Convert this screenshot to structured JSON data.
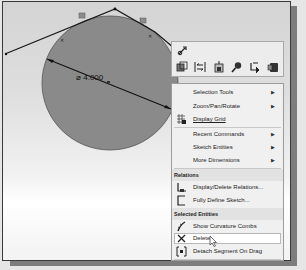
{
  "canvas": {
    "dimension_label": "⌀ 4.000",
    "circle_fill": "#8a8a8a",
    "line_color": "#1a1a1a"
  },
  "context_toolbar": {
    "row1": [
      {
        "name": "rebuild-sketch-icon",
        "glyph": "↹"
      }
    ],
    "row2": [
      {
        "name": "view-orientation-icon",
        "glyph": "▣"
      },
      {
        "name": "dimension-icon",
        "glyph": "↕"
      },
      {
        "name": "smart-dimension-icon",
        "glyph": "▧"
      },
      {
        "name": "zoom-icon",
        "glyph": "⌕"
      },
      {
        "name": "select-other-icon",
        "glyph": "↳"
      },
      {
        "name": "display-style-icon",
        "glyph": "■"
      }
    ]
  },
  "context_menu": {
    "items_top": [
      {
        "label": "Selection Tools",
        "submenu": true
      },
      {
        "label": "Zoom/Pan/Rotate",
        "submenu": true
      },
      {
        "label": "Display Grid",
        "accel": "D",
        "submenu": false,
        "icon": "display-grid-icon"
      }
    ],
    "items_mid": [
      {
        "label": "Recent Commands",
        "accel": "R",
        "submenu": true
      },
      {
        "label": "Sketch Entities",
        "submenu": true
      },
      {
        "label": "More Dimensions",
        "accel": "M",
        "submenu": true
      }
    ],
    "section_relations": {
      "header": "Relations",
      "items": [
        {
          "label": "Display/Delete Relations...",
          "icon": "display-relations-icon"
        },
        {
          "label": "Fully Define Sketch...",
          "icon": "fully-define-sketch-icon"
        }
      ]
    },
    "section_selected": {
      "header": "Selected Entities",
      "items": [
        {
          "label": "Show Curvature Combs",
          "icon": "curvature-combs-icon"
        },
        {
          "label": "Delete",
          "icon": "delete-icon",
          "highlighted": true
        },
        {
          "label": "Detach Segment On Drag",
          "icon": "detach-segment-icon"
        },
        {
          "label": "Sketch Tools",
          "submenu": true
        }
      ]
    }
  }
}
